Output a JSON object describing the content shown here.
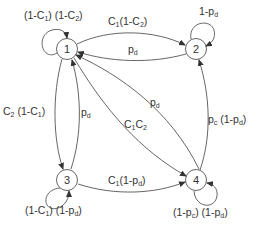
{
  "diagram": {
    "type": "state-transition",
    "nodes": [
      {
        "id": "1",
        "label": "1",
        "x": 67,
        "y": 49
      },
      {
        "id": "2",
        "label": "2",
        "x": 196,
        "y": 49
      },
      {
        "id": "3",
        "label": "3",
        "x": 67,
        "y": 180
      },
      {
        "id": "4",
        "label": "4",
        "x": 196,
        "y": 180
      }
    ],
    "edges": [
      {
        "from": "1",
        "to": "1",
        "label": "(1-C1)(1-C2)"
      },
      {
        "from": "1",
        "to": "2",
        "label": "C1(1-C2)"
      },
      {
        "from": "2",
        "to": "1",
        "label": "pd"
      },
      {
        "from": "2",
        "to": "2",
        "label": "1-pd"
      },
      {
        "from": "1",
        "to": "3",
        "label": "C2(1-C1)"
      },
      {
        "from": "3",
        "to": "1",
        "label": "pd"
      },
      {
        "from": "4",
        "to": "1",
        "label": "pd"
      },
      {
        "from": "1",
        "to": "4",
        "label": "C1C2"
      },
      {
        "from": "3",
        "to": "3",
        "label": "(1-C1)(1-pd)"
      },
      {
        "from": "3",
        "to": "4",
        "label": "C1(1-pd)"
      },
      {
        "from": "4",
        "to": "2",
        "label": "pc(1-pd)"
      },
      {
        "from": "4",
        "to": "4",
        "label": "(1-pc)(1-pd)"
      }
    ]
  },
  "labels": {
    "n1": "1",
    "n2": "2",
    "n3": "3",
    "n4": "4",
    "self1": {
      "a": "(1-C",
      "a_sub": "1",
      "b": ") (1-C",
      "b_sub": "2",
      "c": ")"
    },
    "e12": {
      "a": "C",
      "a_sub": "1",
      "b": "(1-C",
      "b_sub": "2",
      "c": ")"
    },
    "e21": {
      "a": "p",
      "a_sub": "d"
    },
    "self2": {
      "a": "1-p",
      "a_sub": "d"
    },
    "e13": {
      "a": "C",
      "a_sub": "2",
      "b": " (1-C",
      "b_sub": "1",
      "c": ")"
    },
    "e31": {
      "a": "p",
      "a_sub": "d"
    },
    "e41": {
      "a": "p",
      "a_sub": "d"
    },
    "e14": {
      "a": "C",
      "a_sub": "1",
      "b": "C",
      "b_sub": "2"
    },
    "self3": {
      "a": "(1-C",
      "a_sub": "1",
      "b": ") (1-p",
      "b_sub": "d",
      "c": ")"
    },
    "e34": {
      "a": "C",
      "a_sub": "1",
      "b": "(1-p",
      "b_sub": "d",
      "c": ")"
    },
    "e42": {
      "a": "p",
      "a_sub": "c",
      "b": " (1-p",
      "b_sub": "d",
      "c": ")"
    },
    "self4": {
      "a": "(1-p",
      "a_sub": "c",
      "b": ") (1-p",
      "b_sub": "d",
      "c": ")"
    }
  }
}
